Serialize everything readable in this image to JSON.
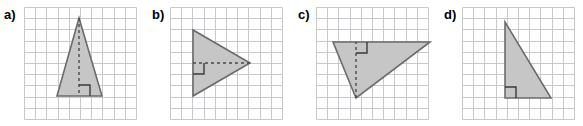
{
  "figure": {
    "background_color": "#ffffff",
    "width": 583,
    "height": 126
  },
  "style": {
    "grid_line_color": "#c9c9cd",
    "grid_line_width": 1,
    "grid_cell_size": 11.2,
    "triangle_fill_color": "#c6c6c6",
    "triangle_stroke_color": "#6b6b6b",
    "triangle_stroke_width": 1.6,
    "altitude_line_color": "#4a4a4a",
    "altitude_dash_pattern": "3,3",
    "altitude_line_width": 1.4,
    "right_angle_marker_color": "#3a3a3a",
    "right_angle_marker_width": 1.4,
    "right_angle_marker_size": 11,
    "label_color": "#000000"
  },
  "panels": [
    {
      "id": "a",
      "label": "a)",
      "label_x": 4,
      "label_y": 11,
      "grid": {
        "x": 24,
        "y": 7,
        "cols": 10,
        "rows": 10,
        "cell": 11.2
      },
      "triangle": {
        "name": "isosceles-triangle-vertical-altitude",
        "vertices": [
          [
            79,
            18
          ],
          [
            57,
            96
          ],
          [
            102,
            96
          ]
        ],
        "shape_note": "isosceles triangle, horizontal base at bottom, apex at top center"
      },
      "altitude": {
        "from": [
          79,
          18
        ],
        "to": [
          79,
          96
        ],
        "orientation": "vertical"
      },
      "right_angle_marker": {
        "x": 79,
        "y": 96,
        "size": 11,
        "corner": "up-right",
        "path": "M 79 85 L 90 85 L 90 96"
      }
    },
    {
      "id": "b",
      "label": "b)",
      "label_x": 152,
      "label_y": 11,
      "grid": {
        "x": 170,
        "y": 7,
        "cols": 10,
        "rows": 10,
        "cell": 11.2
      },
      "triangle": {
        "name": "triangle-pointing-right-horizontal-altitude",
        "vertices": [
          [
            193,
            30
          ],
          [
            193,
            96
          ],
          [
            250,
            63
          ]
        ],
        "shape_note": "isosceles triangle, vertical base at left, apex pointing right"
      },
      "altitude": {
        "from": [
          250,
          63
        ],
        "to": [
          193,
          63
        ],
        "orientation": "horizontal"
      },
      "right_angle_marker": {
        "x": 193,
        "y": 63,
        "size": 11,
        "corner": "down-right",
        "path": "M 193 74 L 204 74 L 204 63"
      }
    },
    {
      "id": "c",
      "label": "c)",
      "label_x": 298,
      "label_y": 11,
      "grid": {
        "x": 316,
        "y": 7,
        "cols": 10,
        "rows": 10,
        "cell": 11.2
      },
      "triangle": {
        "name": "obtuse-triangle-interior-altitude",
        "vertices": [
          [
            333,
            42
          ],
          [
            430,
            42
          ],
          [
            356,
            98
          ]
        ],
        "shape_note": "scalene triangle, horizontal top side, apex at bottom left of center"
      },
      "altitude": {
        "from": [
          356,
          98
        ],
        "to": [
          356,
          42
        ],
        "orientation": "vertical"
      },
      "right_angle_marker": {
        "x": 356,
        "y": 42,
        "size": 11,
        "corner": "down-right",
        "path": "M 356 53 L 367 53 L 367 42"
      }
    },
    {
      "id": "d",
      "label": "d)",
      "label_x": 444,
      "label_y": 11,
      "grid": {
        "x": 462,
        "y": 7,
        "cols": 10,
        "rows": 10,
        "cell": 11.2
      },
      "triangle": {
        "name": "right-triangle-legs-on-grid",
        "vertices": [
          [
            505,
            22
          ],
          [
            505,
            98
          ],
          [
            551,
            98
          ]
        ],
        "shape_note": "right triangle, right angle at bottom-left, vertical leg left, horizontal leg bottom"
      },
      "altitude": null,
      "right_angle_marker": {
        "x": 505,
        "y": 98,
        "size": 11,
        "corner": "up-right",
        "path": "M 505 87 L 516 87 L 516 98"
      }
    }
  ]
}
